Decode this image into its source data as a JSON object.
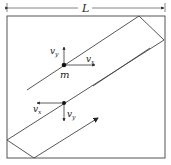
{
  "diagram": {
    "dimension_label": "L",
    "mass_label": "m",
    "upper_point": {
      "vy_label": "v",
      "vy_sub": "y",
      "vx_label": "v",
      "vx_sub": "x"
    },
    "lower_point": {
      "vx_label": "v",
      "vx_sub": "x",
      "vy_label": "v",
      "vy_sub": "y"
    },
    "colors": {
      "line": "#333333",
      "frame": "#555555"
    }
  }
}
